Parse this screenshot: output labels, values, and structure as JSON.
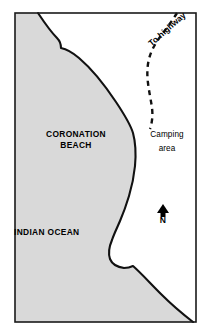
{
  "figure": {
    "kind": "coastal-locality-map",
    "width_px": 215,
    "height_px": 335,
    "background_color": "#ffffff"
  },
  "frame": {
    "border_color": "#1a1a1a",
    "left_px": 15,
    "top_px": 13,
    "right_px": 196,
    "bottom_px": 322
  },
  "land_water": {
    "ocean_fill_color": "#d9d9d9",
    "land_fill_color": "#ffffff",
    "coastline_color": "#111111"
  },
  "labels": {
    "ocean": {
      "name": "INDIAN OCEAN"
    },
    "beach": {
      "line1": "CORONATION",
      "line2": "BEACH"
    },
    "camping": {
      "line1": "Camping",
      "line2": "area"
    },
    "road": {
      "name": "To highway"
    }
  },
  "north_arrow": {
    "letter": "N",
    "color": "#000000",
    "icon": "north-arrow-icon"
  },
  "road": {
    "style": "dashed",
    "color": "#111111",
    "icon": "dashed-road-icon",
    "dash_pattern": "5 4"
  }
}
